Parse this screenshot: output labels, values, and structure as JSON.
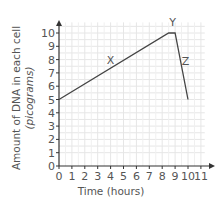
{
  "chart_data": {
    "type": "line",
    "title": "",
    "xlabel": "Time (hours)",
    "ylabel": "Amount of DNA in each cell (picograms)",
    "ylabel_lines": [
      "Amount of DNA in each cell",
      "(picograms)"
    ],
    "xlim": [
      0,
      11
    ],
    "ylim": [
      0,
      10
    ],
    "x_ticks": [
      "0",
      "1",
      "2",
      "3",
      "4",
      "5",
      "6",
      "7",
      "8",
      "9",
      "10",
      "11"
    ],
    "y_ticks": [
      "0",
      "1",
      "2",
      "3",
      "4",
      "5",
      "6",
      "7",
      "8",
      "9",
      "10"
    ],
    "grid": true,
    "legend": null,
    "series": [
      {
        "name": "DNA amount",
        "color": "#444444",
        "x": [
          0,
          8.5,
          9,
          10
        ],
        "y": [
          5,
          10,
          10,
          5
        ]
      }
    ],
    "annotations": [
      {
        "text": "X",
        "x": 4,
        "y": 7.7
      },
      {
        "text": "Y",
        "x": 8.8,
        "y": 10.5
      },
      {
        "text": "Z",
        "x": 9.8,
        "y": 7.6
      }
    ],
    "colors": {
      "grid": "#e6e6e6",
      "axis": "#333333",
      "line": "#444444",
      "text": "#555555"
    }
  }
}
